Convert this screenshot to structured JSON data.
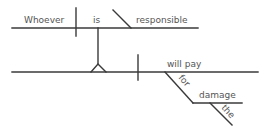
{
  "diagram": {
    "type": "Reed-Kellogg sentence diagram",
    "sentence": "Whoever is responsible will pay for the damage",
    "subject_clause": {
      "subject": "Whoever",
      "verb": "is",
      "complement": "responsible"
    },
    "main_clause": {
      "predicate": "will pay",
      "preposition": "for",
      "object": "damage",
      "modifier": "the"
    },
    "colors": {
      "line": "#3a3a3a",
      "text": "#555555",
      "background": "#ffffff"
    }
  }
}
